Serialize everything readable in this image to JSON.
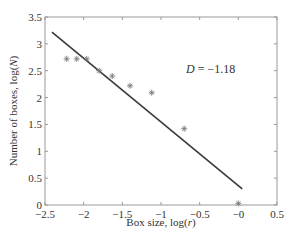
{
  "chart_data": {
    "type": "scatter",
    "title": "",
    "xlabel": "Box size, log(r)",
    "ylabel": "Number of boxes, log(N)",
    "xlim": [
      -2.5,
      0.5
    ],
    "ylim": [
      0,
      3.5
    ],
    "xticks": [
      "-2.5",
      "-2",
      "-1.5",
      "-1",
      "-0.5",
      "-0",
      "0.5"
    ],
    "yticks": [
      "0",
      "0.5",
      "1",
      "1.5",
      "2",
      "2.5",
      "3",
      "3.5"
    ],
    "grid": false,
    "annotation": "D = -1.18",
    "series": [
      {
        "name": "data",
        "marker": "asterisk",
        "points": [
          {
            "x": -2.22,
            "y": 2.72
          },
          {
            "x": -2.09,
            "y": 2.72
          },
          {
            "x": -1.96,
            "y": 2.72
          },
          {
            "x": -1.8,
            "y": 2.5
          },
          {
            "x": -1.63,
            "y": 2.4
          },
          {
            "x": -1.4,
            "y": 2.22
          },
          {
            "x": -1.12,
            "y": 2.09
          },
          {
            "x": -0.7,
            "y": 1.42
          },
          {
            "x": 0.0,
            "y": 0.03
          }
        ]
      },
      {
        "name": "fit",
        "type": "line",
        "points": [
          {
            "x": -2.41,
            "y": 3.22
          },
          {
            "x": 0.05,
            "y": 0.3
          }
        ]
      }
    ]
  }
}
